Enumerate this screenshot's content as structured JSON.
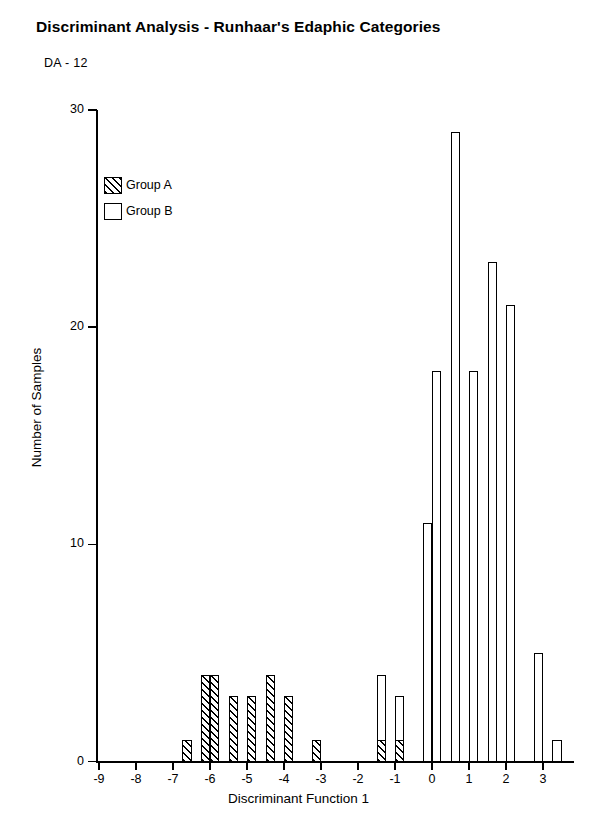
{
  "chart_data": {
    "type": "bar",
    "title": "Discriminant Analysis - Runhaar's Edaphic Categories",
    "subtitle": "DA - 12",
    "xlabel": "Discriminant Function 1",
    "ylabel": "Number of Samples",
    "xlim": [
      -9.6,
      3.45
    ],
    "ylim": [
      0,
      30
    ],
    "bin_width": 0.25,
    "grid": false,
    "legend_position": "upper-left",
    "xticks": [
      -9,
      -8,
      -7,
      -6,
      -5,
      -4,
      -3,
      -2,
      -1,
      0,
      1,
      2,
      3
    ],
    "xtick_labels": [
      "-9",
      "-8",
      "-7",
      "-6",
      "-5",
      "-4",
      "-3",
      "-2",
      "-1",
      "0",
      "1",
      "2",
      "3"
    ],
    "yticks": [
      0,
      10,
      20,
      30
    ],
    "ytick_labels": [
      "0",
      "10",
      "20",
      "30"
    ],
    "legend": [
      {
        "name": "Group A",
        "fill": "hatched"
      },
      {
        "name": "Group B",
        "fill": "white"
      }
    ],
    "series": [
      {
        "name": "Group A",
        "fill": "hatched",
        "bins": [
          {
            "x": -6.75,
            "value": 1
          },
          {
            "x": -6.25,
            "value": 4
          },
          {
            "x": -6.0,
            "value": 4
          },
          {
            "x": -5.5,
            "value": 3
          },
          {
            "x": -5.0,
            "value": 3
          },
          {
            "x": -4.5,
            "value": 4
          },
          {
            "x": -4.0,
            "value": 3
          },
          {
            "x": -3.25,
            "value": 1
          },
          {
            "x": -1.5,
            "value": 1
          },
          {
            "x": -1.0,
            "value": 1
          }
        ]
      },
      {
        "name": "Group B",
        "fill": "white",
        "bins": [
          {
            "x": -1.5,
            "value": 3,
            "base": 1
          },
          {
            "x": -1.0,
            "value": 2,
            "base": 1
          },
          {
            "x": -0.25,
            "value": 11,
            "base": 0
          },
          {
            "x": 0.0,
            "value": 18,
            "base": 0
          },
          {
            "x": 0.5,
            "value": 29,
            "base": 0
          },
          {
            "x": 1.0,
            "value": 18,
            "base": 0
          },
          {
            "x": 1.5,
            "value": 23,
            "base": 0
          },
          {
            "x": 2.0,
            "value": 21,
            "base": 0
          },
          {
            "x": 2.75,
            "value": 5,
            "base": 0
          },
          {
            "x": 3.25,
            "value": 1,
            "base": 0
          }
        ]
      }
    ]
  }
}
